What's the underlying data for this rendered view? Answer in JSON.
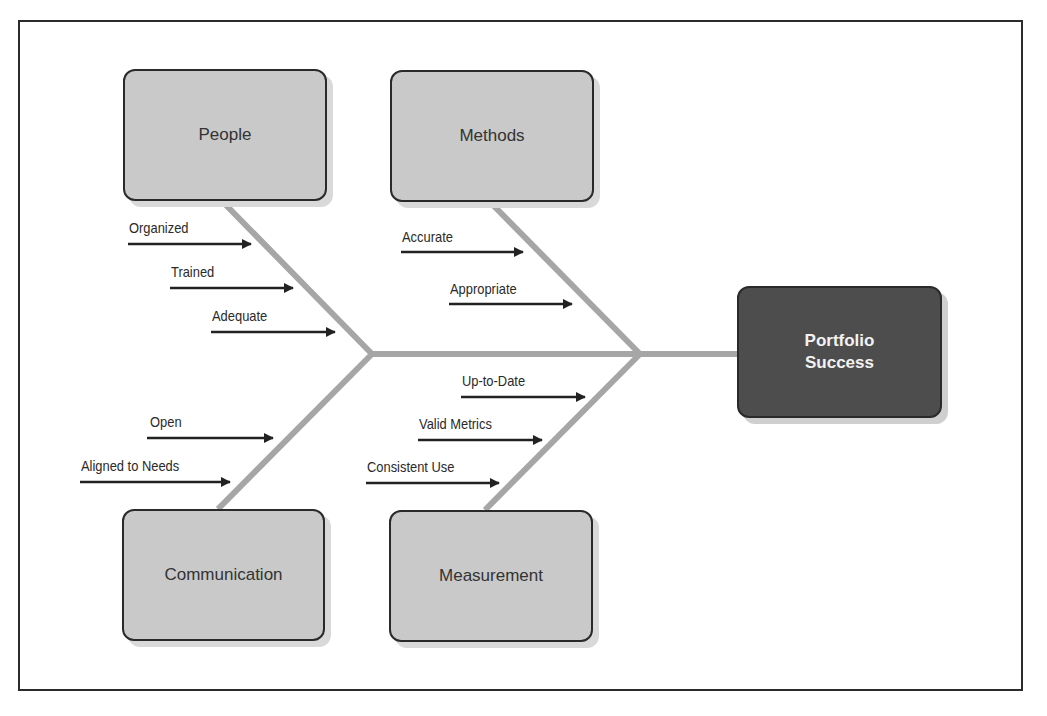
{
  "diagram": {
    "type": "fishbone",
    "effect": {
      "label": "Portfolio\nSuccess",
      "color": "#4d4d4d"
    },
    "spine_color": "#a6a6a6",
    "arrow_color": "#222222",
    "box_color": "#c9c9c9",
    "categories": [
      {
        "id": "people",
        "label": "People",
        "position": "top",
        "causes": [
          "Organized",
          "Trained",
          "Adequate"
        ]
      },
      {
        "id": "methods",
        "label": "Methods",
        "position": "top",
        "causes": [
          "Accurate",
          "Appropriate"
        ]
      },
      {
        "id": "communication",
        "label": "Communication",
        "position": "bottom",
        "causes": [
          "Open",
          "Aligned to Needs"
        ]
      },
      {
        "id": "measurement",
        "label": "Measurement",
        "position": "bottom",
        "causes": [
          "Up-to-Date",
          "Valid Metrics",
          "Consistent Use"
        ]
      }
    ]
  }
}
